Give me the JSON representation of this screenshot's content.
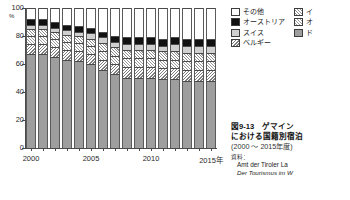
{
  "chart_data": {
    "type": "bar",
    "stacked": true,
    "subtitle": "(2000 ～ 2015年度)",
    "xlabel": "",
    "ylabel": "%",
    "ylim": [
      0,
      100
    ],
    "yticks": [
      0,
      20,
      40,
      60,
      80,
      100
    ],
    "grid": false,
    "legend_position": "top-right",
    "categories": [
      "2000",
      "2001",
      "2002",
      "2003",
      "2004",
      "2005",
      "2006",
      "2007",
      "2008",
      "2009",
      "2010",
      "2011",
      "2012",
      "2013",
      "2014",
      "2015"
    ],
    "xtick_labels": [
      "2000",
      "2005",
      "2010",
      "2015年"
    ],
    "series": [
      {
        "name": "ド",
        "fill": "f-germany",
        "values": [
          67,
          67,
          65,
          63,
          62,
          60,
          56,
          53,
          50,
          50,
          50,
          49,
          49,
          48,
          48,
          48
        ]
      },
      {
        "name": "ベルギー",
        "fill": "f-belgium",
        "values": [
          7,
          7,
          7,
          7,
          7,
          7,
          7,
          7,
          8,
          8,
          8,
          8,
          8,
          8,
          8,
          8
        ]
      },
      {
        "name": "オ",
        "fill": "f-neth",
        "values": [
          6,
          6,
          6,
          6,
          6,
          6,
          6,
          6,
          6,
          6,
          6,
          6,
          6,
          6,
          6,
          6
        ]
      },
      {
        "name": "イ",
        "fill": "f-italy",
        "values": [
          5,
          5,
          5,
          5,
          5,
          5,
          6,
          6,
          6,
          6,
          6,
          6,
          6,
          6,
          6,
          6
        ]
      },
      {
        "name": "スイス",
        "fill": "f-swiss",
        "values": [
          3,
          3,
          3,
          3,
          3,
          4,
          4,
          4,
          4,
          4,
          4,
          4,
          5,
          5,
          5,
          5
        ]
      },
      {
        "name": "オーストリア",
        "fill": "f-austria",
        "values": [
          4,
          4,
          4,
          4,
          4,
          4,
          4,
          4,
          5,
          5,
          5,
          5,
          5,
          5,
          5,
          5
        ]
      },
      {
        "name": "その他",
        "fill": "f-other",
        "values": [
          8,
          8,
          10,
          12,
          13,
          14,
          17,
          20,
          21,
          21,
          21,
          22,
          21,
          22,
          22,
          22
        ]
      }
    ]
  },
  "axis": {
    "unit": "%",
    "yticks": [
      "100",
      "80",
      "60",
      "40",
      "20",
      "0"
    ]
  },
  "legend": {
    "columns": [
      [
        {
          "label": "その他",
          "fill": "f-other"
        },
        {
          "label": "オーストリア",
          "fill": "f-austria"
        },
        {
          "label": "スイス",
          "fill": "f-swiss"
        },
        {
          "label": "ベルギー",
          "fill": "f-belgium"
        }
      ],
      [
        {
          "label": "イ",
          "fill": "f-italy"
        },
        {
          "label": "オ",
          "fill": "f-neth"
        },
        {
          "label": "ド",
          "fill": "f-germany"
        }
      ]
    ]
  },
  "caption": {
    "title": "図9-13　ゲマイン",
    "title_line2": "における国籍別宿泊",
    "period": "(2000 ～ 2015年度)",
    "source_label": "資料：",
    "source_1": "Amt der Tiroler La",
    "source_2": "Der Tourismus im W"
  }
}
